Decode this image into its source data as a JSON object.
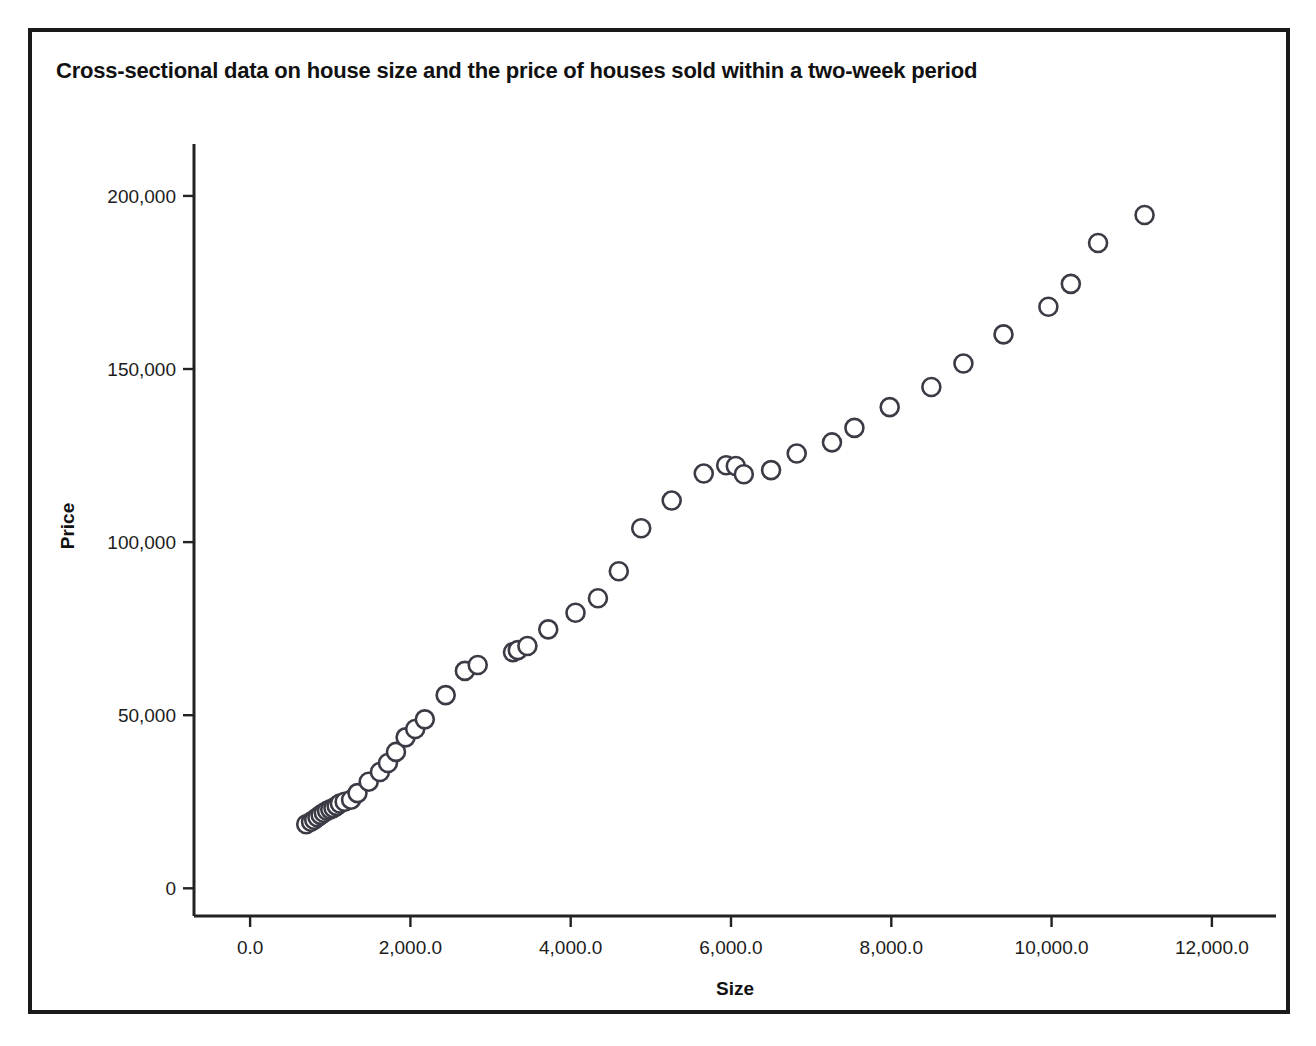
{
  "figure": {
    "title": "Cross-sectional data on house size and the price of houses sold within a two-week period",
    "background_color": "#ffffff",
    "frame_color": "#1a1a1a"
  },
  "chart_data": {
    "type": "scatter",
    "title": "Cross-sectional data on house size and the price of houses sold within a two-week period",
    "xlabel": "Size",
    "ylabel": "Price",
    "xlim": [
      -700,
      12800
    ],
    "ylim": [
      -8000,
      215000
    ],
    "grid": false,
    "legend": null,
    "marker": {
      "shape": "circle",
      "fill": "#ffffff",
      "edge_color": "#3b3b46",
      "radius_px": 9,
      "edge_width_px": 2.6
    },
    "xticks": [
      0,
      2000,
      4000,
      6000,
      8000,
      10000,
      12000
    ],
    "xtick_labels": [
      "0.0",
      "2,000.0",
      "4,000.0",
      "6,000.0",
      "8,000.0",
      "10,000.0",
      "12,000.0"
    ],
    "yticks": [
      0,
      50000,
      100000,
      150000,
      200000
    ],
    "ytick_labels": [
      "0",
      "50,000",
      "100,000",
      "150,000",
      "200,000"
    ],
    "x": [
      700,
      760,
      800,
      840,
      880,
      920,
      960,
      1000,
      1040,
      1080,
      1120,
      1180,
      1260,
      1340,
      1480,
      1620,
      1720,
      1820,
      1940,
      2060,
      2180,
      2440,
      2680,
      2840,
      3280,
      3340,
      3460,
      3720,
      4060,
      4340,
      4600,
      4880,
      5260,
      5660,
      5940,
      6060,
      6160,
      6500,
      6820,
      7260,
      7540,
      7980,
      8500,
      8900,
      9400,
      9960,
      10240,
      10580,
      11160
    ],
    "y": [
      18500,
      19200,
      19800,
      20500,
      21200,
      21800,
      22400,
      22800,
      23200,
      23800,
      24500,
      25000,
      25600,
      27500,
      30800,
      33600,
      36200,
      39400,
      43600,
      46000,
      48800,
      55800,
      62800,
      64500,
      68200,
      68800,
      70000,
      74800,
      79600,
      83800,
      91600,
      104000,
      112000,
      119800,
      122200,
      122000,
      119600,
      120800,
      125600,
      128800,
      133000,
      139000,
      144800,
      151600,
      160000,
      168000,
      174600,
      186400,
      194500
    ],
    "n_points": 49,
    "relationship": "strong positive linear"
  },
  "axes": {
    "x_axis_name": "size-axis",
    "y_axis_name": "price-axis"
  }
}
